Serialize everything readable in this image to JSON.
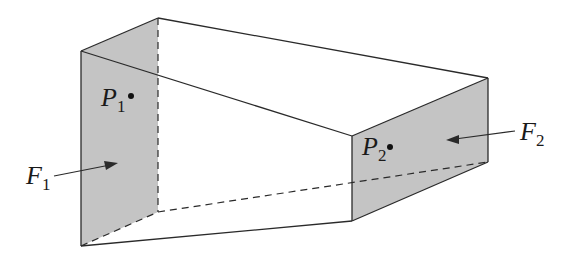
{
  "diagram": {
    "colors": {
      "face_fill": "#c4c4c4",
      "line": "#2a2a2a",
      "background": "#ffffff"
    },
    "faces": [
      {
        "label": "F",
        "subscript": "1",
        "point_label": "P",
        "point_subscript": "1"
      },
      {
        "label": "F",
        "subscript": "2",
        "point_label": "P",
        "point_subscript": "2"
      }
    ]
  }
}
